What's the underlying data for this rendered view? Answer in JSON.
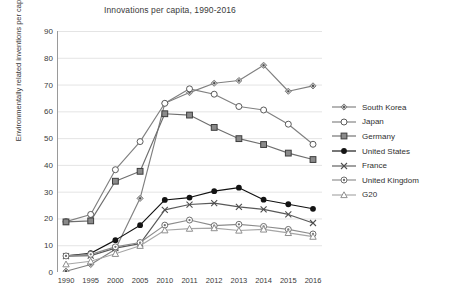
{
  "chart_data": {
    "type": "line",
    "title": "Innovations per capita, 1990-2016",
    "xlabel": "",
    "ylabel": "Environmentally related inventions per capita",
    "categories": [
      "1990",
      "1995",
      "2000",
      "2005",
      "2010",
      "2011",
      "2012",
      "2013",
      "2014",
      "2015",
      "2016"
    ],
    "ylim": [
      0,
      90
    ],
    "ytick_step": 10,
    "yticks": [
      "90",
      "80",
      "70",
      "60",
      "50",
      "40",
      "30",
      "20",
      "10",
      "0"
    ],
    "grid": "horizontal",
    "legend_position": "right",
    "series": [
      {
        "name": "South Korea",
        "marker": "diamond",
        "color": "#7f7f7f",
        "values": [
          0.3,
          2.8,
          8.5,
          27.5,
          63.0,
          67.0,
          70.5,
          71.5,
          77.2,
          67.5,
          69.5
        ]
      },
      {
        "name": "Japan",
        "marker": "open-circle",
        "color": "#808080",
        "values": [
          18.8,
          21.5,
          38.2,
          48.7,
          63.0,
          68.4,
          66.4,
          61.8,
          60.5,
          55.2,
          47.7
        ]
      },
      {
        "name": "Germany",
        "marker": "filled-square",
        "color": "#6e6e6e",
        "values": [
          18.7,
          19.1,
          33.9,
          37.6,
          59.1,
          58.6,
          54.0,
          49.8,
          47.6,
          44.4,
          42.0
        ]
      },
      {
        "name": "United States",
        "marker": "filled-circle",
        "color": "#111111",
        "values": [
          6.0,
          7.0,
          11.9,
          17.5,
          26.9,
          27.8,
          30.2,
          31.5,
          27.0,
          25.3,
          23.6
        ]
      },
      {
        "name": "France",
        "marker": "cross",
        "color": "#595959",
        "values": [
          5.9,
          6.1,
          8.9,
          10.6,
          23.2,
          25.2,
          25.7,
          24.3,
          23.4,
          21.5,
          18.3
        ]
      },
      {
        "name": "United Kingdom",
        "marker": "dot-circle",
        "color": "#8c8c8c",
        "values": [
          6.0,
          6.6,
          9.4,
          11.0,
          17.5,
          19.4,
          17.3,
          17.8,
          17.0,
          15.9,
          14.2
        ]
      },
      {
        "name": "G20",
        "marker": "open-triangle",
        "color": "#a6a6a6",
        "values": [
          2.9,
          4.0,
          6.8,
          9.8,
          15.6,
          16.2,
          16.4,
          15.5,
          15.9,
          14.6,
          13.2
        ]
      }
    ]
  },
  "legend": {
    "items": [
      {
        "label": "South Korea"
      },
      {
        "label": "Japan"
      },
      {
        "label": "Germany"
      },
      {
        "label": "United States"
      },
      {
        "label": "France"
      },
      {
        "label": "United Kingdom"
      },
      {
        "label": "G20"
      }
    ]
  }
}
